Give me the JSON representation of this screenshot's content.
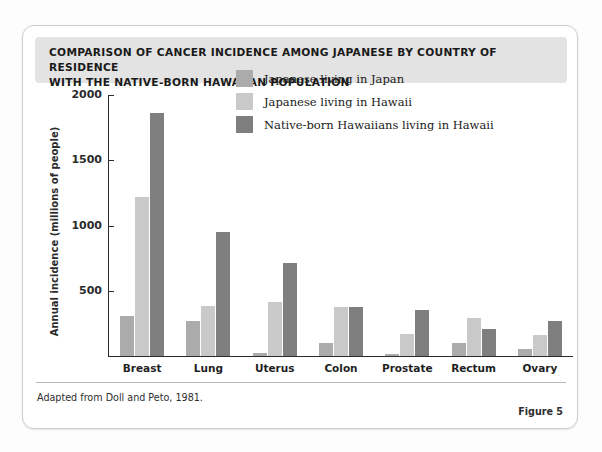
{
  "figure": {
    "title": "COMPARISON OF CANCER INCIDENCE AMONG JAPANESE BY COUNTRY OF RESIDENCE WITH THE NATIVE-BORN HAWAIIAN POPULATION",
    "title_line1": "COMPARISON OF CANCER INCIDENCE AMONG JAPANESE BY COUNTRY OF RESIDENCE",
    "title_line2": "WITH THE NATIVE-BORN HAWAIIAN POPULATION",
    "source_note": "Adapted from Doll and Peto, 1981.",
    "figure_number": "Figure 5"
  },
  "colors": {
    "series_japan": "#ababab",
    "series_hawaii_japanese": "#c9c9c9",
    "series_native_hawaiian": "#7f7f7f",
    "title_band": "#e3e3e3",
    "axis": "#2b2b2b",
    "card_border": "#cfcfcf"
  },
  "chart_data": {
    "type": "bar",
    "title": "COMPARISON OF CANCER INCIDENCE AMONG JAPANESE BY COUNTRY OF RESIDENCE WITH THE NATIVE-BORN HAWAIIAN POPULATION",
    "xlabel": "",
    "ylabel": "Annual incidence (millions of people)",
    "categories": [
      "Breast",
      "Lung",
      "Uterus",
      "Colon",
      "Prostate",
      "Rectum",
      "Ovary"
    ],
    "series": [
      {
        "name": "Japanese living in Japan",
        "color": "#ababab",
        "values": [
          310,
          265,
          25,
          100,
          15,
          100,
          55
        ]
      },
      {
        "name": "Japanese living in Hawaii",
        "color": "#c9c9c9",
        "values": [
          1215,
          385,
          415,
          375,
          165,
          295,
          160
        ]
      },
      {
        "name": "Native-born Hawaiians living in Hawaii",
        "color": "#7f7f7f",
        "values": [
          1865,
          950,
          710,
          375,
          350,
          210,
          270
        ]
      }
    ],
    "ylim": [
      0,
      2000
    ],
    "yticks": [
      0,
      500,
      1000,
      1500,
      2000
    ],
    "ytick_labels": [
      "",
      "500",
      "1000",
      "1500",
      "2000"
    ],
    "grid": false,
    "legend_position": "upper center"
  }
}
